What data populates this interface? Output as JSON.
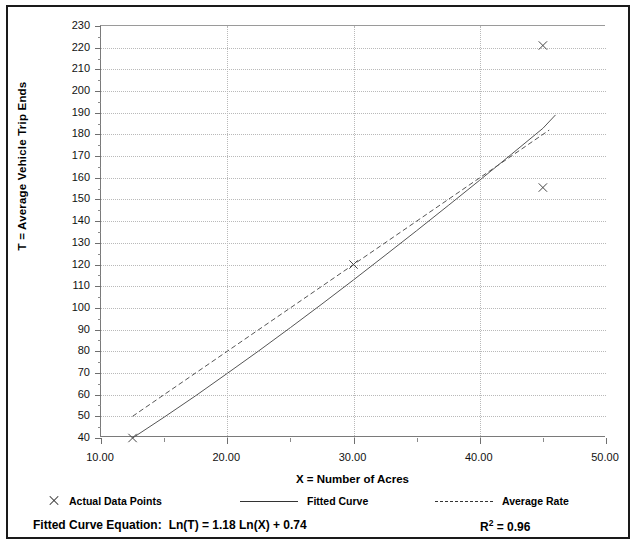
{
  "chart_data": {
    "type": "line",
    "title": "",
    "xlabel": "X = Number of Acres",
    "ylabel": "T = Average Vehicle Trip Ends",
    "xlim": [
      10,
      50
    ],
    "ylim": [
      40,
      230
    ],
    "xticks": [
      10,
      15,
      20,
      25,
      30,
      35,
      40,
      45,
      50
    ],
    "xtick_labels": [
      "10.00",
      "",
      "20.00",
      "",
      "30.00",
      "",
      "40.00",
      "",
      "50.00"
    ],
    "xtick_major": [
      10,
      20,
      30,
      40,
      50
    ],
    "yticks": [
      40,
      50,
      60,
      70,
      80,
      90,
      100,
      110,
      120,
      130,
      140,
      150,
      160,
      170,
      180,
      190,
      200,
      210,
      220,
      230
    ],
    "ytick_labels": [
      "40",
      "50",
      "60",
      "70",
      "80",
      "90",
      "100",
      "110",
      "120",
      "130",
      "140",
      "150",
      "160",
      "170",
      "180",
      "190",
      "200",
      "210",
      "220",
      "230"
    ],
    "grid": true,
    "legend_position": "below-plot",
    "series": [
      {
        "name": "Actual Data Points",
        "marker": "x",
        "style": "scatter",
        "points": [
          {
            "x": 12.5,
            "y": 40
          },
          {
            "x": 30.0,
            "y": 120
          },
          {
            "x": 45.0,
            "y": 155.5
          },
          {
            "x": 45.0,
            "y": 221
          }
        ]
      },
      {
        "name": "Fitted Curve",
        "style": "solid",
        "points": [
          {
            "x": 12.5,
            "y": 40
          },
          {
            "x": 15.0,
            "y": 49.6
          },
          {
            "x": 17.5,
            "y": 59.5
          },
          {
            "x": 20.0,
            "y": 69.8
          },
          {
            "x": 22.5,
            "y": 80.2
          },
          {
            "x": 25.0,
            "y": 90.9
          },
          {
            "x": 27.5,
            "y": 101.8
          },
          {
            "x": 30.0,
            "y": 112.9
          },
          {
            "x": 32.5,
            "y": 124.2
          },
          {
            "x": 35.0,
            "y": 135.6
          },
          {
            "x": 37.5,
            "y": 147.2
          },
          {
            "x": 40.0,
            "y": 158.9
          },
          {
            "x": 42.5,
            "y": 170.8
          },
          {
            "x": 45.0,
            "y": 182.8
          },
          {
            "x": 46.0,
            "y": 189.0
          }
        ]
      },
      {
        "name": "Average Rate",
        "style": "dashed",
        "points": [
          {
            "x": 12.5,
            "y": 50
          },
          {
            "x": 45.5,
            "y": 182
          }
        ]
      }
    ]
  },
  "legend": {
    "items": [
      {
        "label": "Actual Data Points",
        "marker": "x-marker"
      },
      {
        "label": "Fitted Curve",
        "marker": "solid-line"
      },
      {
        "label": "Average Rate",
        "marker": "dashed-line"
      }
    ]
  },
  "footer": {
    "equation_label": "Fitted Curve Equation:",
    "equation_value": "Ln(T) = 1.18 Ln(X) + 0.74",
    "r_squared_symbol": "R",
    "r_squared_exponent": "2",
    "r_squared_value": "= 0.96"
  }
}
